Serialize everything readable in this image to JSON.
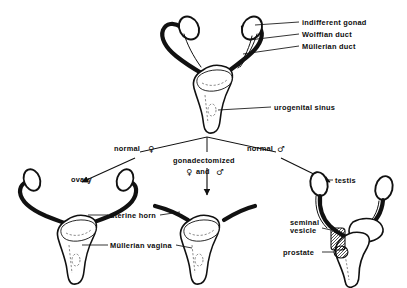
{
  "figure": {
    "background_color": "#ffffff",
    "ink_color": "#111111"
  },
  "stages": {
    "indifferent": {
      "name": "indifferent-stage-specimen",
      "labels": [
        {
          "id": "indifferent-gonad",
          "text": "indifferent gonad"
        },
        {
          "id": "wolffian-duct",
          "text": "Wolffian duct"
        },
        {
          "id": "mullerian-duct",
          "text": "Müllerian duct"
        },
        {
          "id": "urogenital-sinus",
          "text": "urogenital sinus"
        }
      ]
    },
    "female": {
      "name": "normal-female-specimen",
      "pathway_label": "normal",
      "pathway_symbol": "♀",
      "labels": [
        {
          "id": "ovary",
          "text": "ovary"
        }
      ]
    },
    "gonadectomized": {
      "name": "gonadectomized-specimen",
      "line1": "gonadectomized",
      "symbol_female": "♀",
      "conjunction": "and",
      "symbol_male": "♂",
      "shared_labels": [
        {
          "id": "uterine-horn",
          "text": "uterine horn"
        },
        {
          "id": "mullerian-vagina",
          "text": "Müllerian vagina"
        }
      ]
    },
    "male": {
      "name": "normal-male-specimen",
      "pathway_label": "normal",
      "pathway_symbol": "♂",
      "labels": [
        {
          "id": "testis",
          "text": "testis"
        },
        {
          "id": "seminal-vesicle-line1",
          "text": "seminal"
        },
        {
          "id": "seminal-vesicle-line2",
          "text": "vesicle"
        },
        {
          "id": "prostate",
          "text": "prostate"
        }
      ]
    }
  }
}
